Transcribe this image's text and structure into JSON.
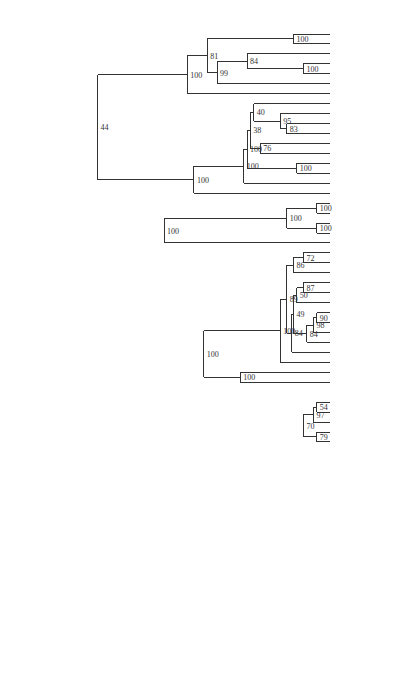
{
  "chart_data": {
    "type": "dendrogram",
    "title": "",
    "axis": {
      "label": "",
      "ticks": [
        9000,
        8000,
        7000,
        6000,
        5000,
        4000,
        3000,
        2000,
        1000
      ],
      "range": [
        9000,
        0
      ],
      "orientation": "horizontal, labels rotated 90deg"
    },
    "leaves": [
      "Afghan",
      "Waziri",
      "Baluchi",
      "Persian",
      "Tadzik",
      "Wakhi",
      "Ossetic",
      "Bengali",
      "Hindi",
      "Lahnda",
      "Panjabi",
      "Gujarati",
      "Marathi",
      "Khaskura",
      "Nepali",
      "Kashmiri",
      "Singhalese",
      "Breton",
      "BretonSE",
      "WelshC",
      "WelshN",
      "IrishA",
      "Bulgarian",
      "Macedonian",
      "Serbocroatian",
      "Byelorussian",
      "Ukrainian",
      "Polish",
      "Czech",
      "Slovak",
      "CzechE",
      "LusatianU",
      "Russian",
      "Slovenian",
      "Latvian",
      "LithuanianST",
      "Catalán",
      "French",
      "Provençal",
      "Walloon",
      "Italian",
      "Ladin",
      "Portuguese",
      "Spanish",
      "SardinianC",
      "SardinianL",
      "SardinianN",
      "Rumanian",
      "Danish",
      "Swedish",
      "Riksmal",
      "Faroese",
      "Icelandic",
      "Dutch",
      "German",
      "Frisian",
      "English",
      "GreekML",
      "GreekMod",
      "ArmenianMod",
      "AlbanianG",
      "AlbanianT",
      "AlbanianTop"
    ],
    "nodes": [
      {
        "id": "afg",
        "age": 1100,
        "support": 100,
        "children": [
          "Afghan",
          "Waziri"
        ]
      },
      {
        "id": "pt",
        "age": 800,
        "support": 100,
        "children": [
          "Persian",
          "Tadzik"
        ]
      },
      {
        "id": "bpt",
        "age": 2500,
        "support": 84,
        "children": [
          "Baluchi",
          "pt"
        ]
      },
      {
        "id": "iran1",
        "age": 3400,
        "support": 99,
        "children": [
          "bpt",
          "Wakhi"
        ]
      },
      {
        "id": "iran2",
        "age": 3700,
        "support": 81,
        "children": [
          "afg",
          "iran1"
        ]
      },
      {
        "id": "iran",
        "age": 4300,
        "support": 100,
        "children": [
          "iran2",
          "Ossetic"
        ]
      },
      {
        "id": "lp",
        "age": 1300,
        "support": 83,
        "children": [
          "Lahnda",
          "Panjabi"
        ]
      },
      {
        "id": "hlp",
        "age": 1500,
        "support": 95,
        "children": [
          "Hindi",
          "lp"
        ]
      },
      {
        "id": "bhlp",
        "age": 2300,
        "support": 40,
        "children": [
          "Bengali",
          "hlp"
        ]
      },
      {
        "id": "gm",
        "age": 2100,
        "support": 76,
        "children": [
          "Gujarati",
          "Marathi"
        ]
      },
      {
        "id": "ind1",
        "age": 2400,
        "support": 38,
        "children": [
          "bhlp",
          "gm"
        ]
      },
      {
        "id": "ind2",
        "age": 2500,
        "support": 100,
        "children": [
          "ind1",
          "kn"
        ]
      },
      {
        "id": "kn",
        "age": 1000,
        "support": 100,
        "children": [
          "Khaskura",
          "Nepali"
        ]
      },
      {
        "id": "ind3",
        "age": 2600,
        "support": 100,
        "children": [
          "ind2",
          "Kashmiri"
        ]
      },
      {
        "id": "ind",
        "age": 4100,
        "support": 100,
        "children": [
          "ind3",
          "Singhalese"
        ]
      },
      {
        "id": "indoiran",
        "age": 7000,
        "support": 44,
        "children": [
          "iran",
          "ind"
        ]
      },
      {
        "id": "bret",
        "age": 400,
        "support": 100,
        "children": [
          "Breton",
          "BretonSE"
        ]
      },
      {
        "id": "welsh",
        "age": 400,
        "support": 100,
        "children": [
          "WelshC",
          "WelshN"
        ]
      },
      {
        "id": "brit",
        "age": 1300,
        "support": 100,
        "children": [
          "bret",
          "welsh"
        ]
      },
      {
        "id": "celtic",
        "age": 5000,
        "support": 100,
        "children": [
          "brit",
          "IrishA"
        ]
      },
      {
        "id": "bm",
        "age": 800,
        "support": 72,
        "children": [
          "Bulgarian",
          "Macedonian"
        ]
      },
      {
        "id": "sslav",
        "age": 1100,
        "support": 86,
        "children": [
          "bm",
          "Serbocroatian"
        ]
      },
      {
        "id": "bu",
        "age": 800,
        "support": 87,
        "children": [
          "Byelorussian",
          "Ukrainian"
        ]
      },
      {
        "id": "bup",
        "age": 1000,
        "support": 50,
        "children": [
          "bu",
          "Polish"
        ]
      },
      {
        "id": "cs",
        "age": 400,
        "support": 90,
        "children": [
          "Czech",
          "Slovak"
        ]
      },
      {
        "id": "cse",
        "age": 500,
        "support": 98,
        "children": [
          "cs",
          "CzechE"
        ]
      },
      {
        "id": "csel",
        "age": 700,
        "support": 84,
        "children": [
          "cse",
          "LusatianU"
        ]
      },
      {
        "id": "wslav",
        "age": 1100,
        "support": 49,
        "children": [
          "bup",
          "csel"
        ]
      },
      {
        "id": "nslav",
        "age": 1150,
        "support": 84,
        "children": [
          "wslav",
          "Russian"
        ]
      },
      {
        "id": "slav1",
        "age": 1300,
        "support": 89,
        "children": [
          "sslav",
          "nslav"
        ]
      },
      {
        "id": "slav",
        "age": 1500,
        "support": 100,
        "children": [
          "slav1",
          "Slovenian"
        ]
      },
      {
        "id": "baltic",
        "age": 2700,
        "support": 100,
        "children": [
          "Latvian",
          "LithuanianST"
        ]
      },
      {
        "id": "baltoslav",
        "age": 3800,
        "support": 100,
        "children": [
          "slav",
          "baltic"
        ]
      },
      {
        "id": "fp",
        "age": 400,
        "support": 54,
        "children": [
          "French",
          "Provençal"
        ]
      },
      {
        "id": "fpw",
        "age": 500,
        "support": 97,
        "children": [
          "fp",
          "Walloon"
        ]
      },
      {
        "id": "il",
        "age": 400,
        "support": 79,
        "children": [
          "Italian",
          "Ladin"
        ]
      },
      {
        "id": "rom1",
        "age": 800,
        "support": 70,
        "children": [
          "fpw",
          "il"
        ]
      },
      {
        "id": "rom2",
        "age": 900,
        "support": 49,
        "children": [
          "rom1",
          "cat"
        ]
      },
      {
        "id": "cat",
        "age": 1000,
        "support": 88,
        "children": [
          "Catalán",
          "rom2"
        ]
      },
      {
        "id": "ps",
        "age": 500,
        "support": 100,
        "children": [
          "Portuguese",
          "Spanish"
        ]
      },
      {
        "id": "rom3",
        "age": 1000,
        "support": 97,
        "children": [
          "cat",
          "ps"
        ]
      },
      {
        "id": "sl",
        "age": 500,
        "support": 88,
        "children": [
          "SardinianC",
          "SardinianL"
        ]
      },
      {
        "id": "sard",
        "age": 600,
        "support": 95,
        "children": [
          "sl",
          "SardinianN"
        ]
      },
      {
        "id": "rom4",
        "age": 1400,
        "support": 100,
        "children": [
          "rom3",
          "sard"
        ]
      },
      {
        "id": "romance",
        "age": 1700,
        "support": 97,
        "children": [
          "rom4",
          "Rumanian"
        ]
      },
      {
        "id": "ds",
        "age": 400,
        "support": 68,
        "children": [
          "Danish",
          "Swedish"
        ]
      },
      {
        "id": "dsr",
        "age": 500,
        "support": 90,
        "children": [
          "ds",
          "Riksmal"
        ]
      },
      {
        "id": "fi",
        "age": 400,
        "support": 100,
        "children": [
          "Faroese",
          "Icelandic"
        ]
      },
      {
        "id": "nord",
        "age": 700,
        "support": 100,
        "children": [
          "dsr",
          "fi"
        ]
      },
      {
        "id": "dg",
        "age": 500,
        "support": 93,
        "children": [
          "Dutch",
          "German"
        ]
      },
      {
        "id": "dgf",
        "age": 700,
        "support": 100,
        "children": [
          "dg",
          "Frisian"
        ]
      },
      {
        "id": "germ1",
        "age": 1600,
        "support": 93,
        "children": [
          "nord",
          "dgf"
        ]
      },
      {
        "id": "germanic",
        "age": 2100,
        "support": 100,
        "children": [
          "germ1",
          "English"
        ]
      },
      {
        "id": "romgerm",
        "age": 4700,
        "support": 54,
        "children": [
          "romance",
          "germanic"
        ]
      },
      {
        "id": "bsrg",
        "age": 4800,
        "support": 95,
        "children": [
          "baltoslav",
          "romgerm"
        ]
      },
      {
        "id": "core",
        "age": 6400,
        "support": 82,
        "children": [
          "celtic",
          "bsrg"
        ]
      },
      {
        "id": "greek",
        "age": 900,
        "support": 100,
        "children": [
          "GreekML",
          "GreekMod"
        ]
      },
      {
        "id": "cg",
        "age": 7000,
        "support": 31,
        "children": [
          "core",
          "greek"
        ]
      },
      {
        "id": "ie1",
        "age": 7800,
        "support": 29,
        "children": [
          "indoiran",
          "cg"
        ]
      },
      {
        "id": "ie2",
        "age": 8300,
        "support": null,
        "children": [
          "ie1",
          "ArmenianMod"
        ]
      },
      {
        "id": "alb1",
        "age": 600,
        "support": 93,
        "children": [
          "AlbanianT",
          "AlbanianTop"
        ]
      },
      {
        "id": "alb",
        "age": 1100,
        "support": 100,
        "children": [
          "AlbanianG",
          "alb1"
        ]
      },
      {
        "id": "root",
        "age": 8800,
        "support": 71,
        "children": [
          "ie2",
          "alb"
        ]
      }
    ]
  },
  "axis_ticks": [
    "9000",
    "8000",
    "7000",
    "6000",
    "5000",
    "4000",
    "3000",
    "2000",
    "1000"
  ]
}
